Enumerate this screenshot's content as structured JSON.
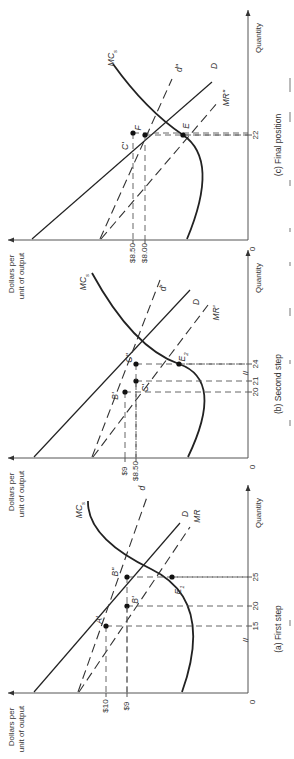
{
  "figure": {
    "orientation": "rotated 90 degrees counter-clockwise",
    "y_axis_label_line1": "Dollars per",
    "y_axis_label_line2": "unit of output",
    "x_axis_label": "Quantity",
    "origin_label": "0"
  },
  "panels": [
    {
      "id": "a",
      "caption": "(a)  First step",
      "price_ticks": [
        {
          "label": "$10",
          "value": 10
        },
        {
          "label": "$9",
          "value": 9
        }
      ],
      "quantity_ticks": [
        {
          "label": "15",
          "value": 15
        },
        {
          "label": "20",
          "value": 20
        },
        {
          "label": "25",
          "value": 25
        }
      ],
      "axis_break": "//",
      "curves": [
        {
          "name": "D",
          "label": "D",
          "style": "solid"
        },
        {
          "name": "d",
          "label": "d",
          "style": "dashed"
        },
        {
          "name": "MR",
          "label": "MR",
          "style": "dashed"
        },
        {
          "name": "MCs",
          "label": "MC",
          "subscript": "s",
          "style": "solid-thick"
        }
      ],
      "points": [
        {
          "label": "A'",
          "quantity": 15,
          "price": 10
        },
        {
          "label": "B'",
          "quantity": 20,
          "price": 9
        },
        {
          "label": "B''",
          "quantity": 25,
          "price": 9
        },
        {
          "label": "E1",
          "quantity": 25,
          "price": null
        }
      ]
    },
    {
      "id": "b",
      "caption": "(b)  Second step",
      "price_ticks": [
        {
          "label": "$9",
          "value": 9
        },
        {
          "label": "$8.50",
          "value": 8.5
        }
      ],
      "quantity_ticks": [
        {
          "label": "20",
          "value": 20
        },
        {
          "label": "21",
          "value": 21
        },
        {
          "label": "24",
          "value": 24
        }
      ],
      "axis_break": "//",
      "curves": [
        {
          "name": "D",
          "label": "D",
          "style": "solid"
        },
        {
          "name": "d'",
          "label": "d'",
          "style": "dashed"
        },
        {
          "name": "MR'",
          "label": "MR'",
          "style": "dashed"
        },
        {
          "name": "MCs",
          "label": "MC",
          "subscript": "s",
          "style": "solid-thick"
        }
      ],
      "points": [
        {
          "label": "B'",
          "quantity": 20,
          "price": 9
        },
        {
          "label": "C'",
          "quantity": 21,
          "price": 8.5
        },
        {
          "label": "C''",
          "quantity": 24,
          "price": 8.5
        },
        {
          "label": "E2",
          "quantity": 24,
          "price": null
        }
      ]
    },
    {
      "id": "c",
      "caption": "(c)  Final position",
      "price_ticks": [
        {
          "label": "$8.50",
          "value": 8.5
        },
        {
          "label": "$8.00",
          "value": 8.0
        }
      ],
      "quantity_ticks": [
        {
          "label": "22",
          "value": 22
        }
      ],
      "curves": [
        {
          "name": "D",
          "label": "D",
          "style": "solid"
        },
        {
          "name": "d''",
          "label": "d''",
          "style": "dashed"
        },
        {
          "name": "MR''",
          "label": "MR''",
          "style": "dashed"
        },
        {
          "name": "MCs",
          "label": "MC",
          "subscript": "s",
          "style": "solid-thick"
        }
      ],
      "points": [
        {
          "label": "C'",
          "quantity": 21,
          "price": 8.5
        },
        {
          "label": "F",
          "quantity": 22,
          "price": 8.0
        },
        {
          "label": "E",
          "quantity": 22,
          "price": null
        }
      ]
    }
  ]
}
